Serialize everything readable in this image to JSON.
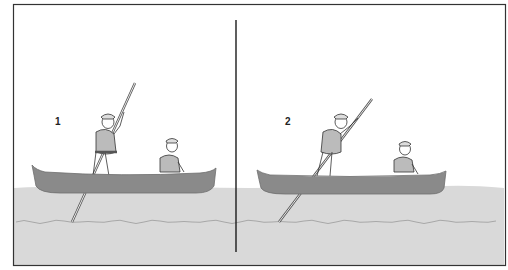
{
  "figure": {
    "colors": {
      "background": "#ffffff",
      "water": "#d9d9d9",
      "canoe": "#8a8a8a",
      "canoe_edge": "#6e6e6e",
      "frame": "#333333",
      "divider": "#1a1a1a",
      "pole": "#bbbbbb"
    },
    "panels": [
      {
        "step_label": "1",
        "caption": "Standing paddler plants pole on river bottom near the bow"
      },
      {
        "step_label": "2",
        "caption": "Standing paddler pushes along pole, leaning forward"
      }
    ]
  }
}
